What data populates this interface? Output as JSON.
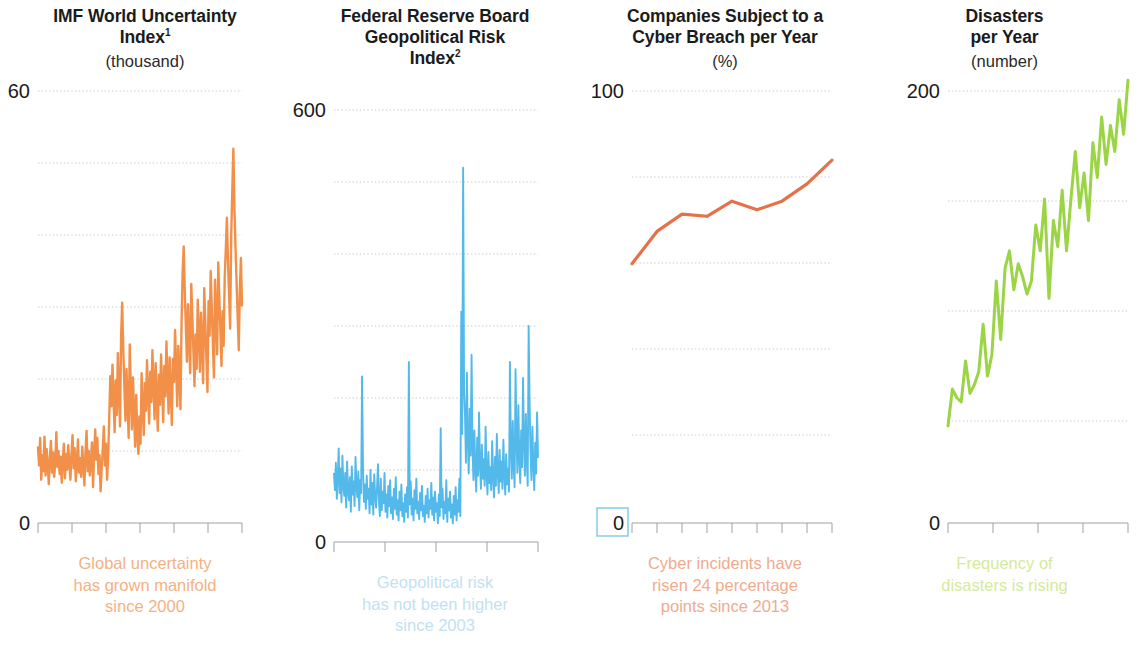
{
  "figure": {
    "background": "#ffffff",
    "panel_count": 4
  },
  "panels": [
    {
      "title_main": "IMF World Uncertainty",
      "title_second": "Index",
      "title_sup": "1",
      "units": "(thousand)",
      "y_top_label": "60",
      "y_bottom_label": "0",
      "caption": "Global uncertainty has grown manifold since 2000",
      "caption_line1": "Global uncertainty",
      "caption_line2": "has grown manifold",
      "caption_line3": "since 2000",
      "line_color": "#F2904A",
      "caption_color": "#f4b183",
      "highlighted_zero": false
    },
    {
      "title_main": "Federal Reserve Board",
      "title_second": "Geopolitical Risk",
      "title_third": "Index",
      "title_sup": "2",
      "units": "",
      "y_top_label": "600",
      "y_bottom_label": "0",
      "caption": "Geopolitical risk has not been higher since 2003",
      "caption_line1": "Geopolitical risk",
      "caption_line2": "has not been higher",
      "caption_line3": "since 2003",
      "line_color": "#52B9EA",
      "caption_color": "#bfe2f2",
      "highlighted_zero": false
    },
    {
      "title_main": "Companies Subject to a",
      "title_second": "Cyber Breach per Year",
      "units": "(%)",
      "y_top_label": "100",
      "y_bottom_label": "0",
      "caption": "Cyber incidents have risen 24 percentage points since 2013",
      "caption_line1": "Cyber incidents have",
      "caption_line2": "risen 24 percentage",
      "caption_line3": "points since 2013",
      "line_color": "#E4714A",
      "caption_color": "#f0ab8d",
      "highlighted_zero": true,
      "highlight_color": "#8ecfe8"
    },
    {
      "title_main": "Disasters",
      "title_second": "per Year",
      "units": "(number)",
      "y_top_label": "200",
      "y_bottom_label": "0",
      "caption": "Frequency of disasters is rising",
      "caption_line1": "Frequency of",
      "caption_line2": "disasters is rising",
      "caption_line3": "",
      "line_color": "#9BD445",
      "caption_color": "#d5ea9a",
      "highlighted_zero": false
    }
  ],
  "chart_data": [
    {
      "type": "line",
      "title": "IMF World Uncertainty Index",
      "ylabel": "thousand",
      "xlabel": "",
      "ylim": [
        0,
        60
      ],
      "gridlines": [
        10,
        20,
        30,
        40,
        50,
        60
      ],
      "x_ticks": 7,
      "color": "#F2904A",
      "values": [
        10.5,
        8.0,
        11.8,
        6.0,
        9.4,
        7.2,
        12.0,
        6.6,
        10.3,
        8.2,
        5.4,
        9.0,
        11.4,
        7.0,
        9.8,
        6.4,
        8.4,
        12.6,
        7.8,
        10.0,
        6.8,
        9.2,
        5.6,
        8.8,
        11.0,
        6.2,
        9.6,
        7.4,
        10.8,
        8.6,
        6.0,
        9.4,
        12.2,
        7.6,
        10.4,
        5.8,
        8.2,
        11.6,
        7.0,
        9.0,
        6.4,
        10.6,
        8.0,
        5.2,
        9.8,
        12.8,
        7.2,
        10.0,
        6.6,
        8.4,
        11.2,
        5.0,
        9.6,
        13.0,
        8.8,
        11.8,
        6.8,
        9.4,
        4.4,
        7.6,
        10.2,
        13.4,
        8.0,
        11.0,
        6.0,
        9.2,
        14.6,
        20.4,
        16.2,
        22.0,
        17.4,
        12.6,
        19.8,
        15.0,
        23.6,
        18.2,
        13.4,
        26.0,
        30.6,
        24.2,
        19.0,
        14.2,
        21.4,
        16.6,
        11.8,
        24.8,
        18.6,
        13.0,
        20.2,
        15.4,
        10.6,
        17.8,
        12.4,
        9.6,
        14.8,
        11.0,
        20.8,
        16.0,
        12.2,
        19.4,
        15.6,
        22.6,
        18.0,
        13.8,
        21.0,
        16.8,
        24.0,
        19.2,
        14.4,
        22.2,
        17.2,
        12.8,
        20.6,
        16.4,
        23.4,
        18.8,
        14.0,
        21.8,
        17.6,
        25.2,
        20.0,
        15.2,
        23.0,
        18.4,
        13.6,
        22.8,
        19.6,
        26.8,
        21.6,
        16.2,
        24.6,
        20.4,
        15.8,
        28.0,
        34.8,
        38.4,
        32.0,
        27.2,
        22.4,
        30.4,
        25.6,
        20.8,
        33.2,
        28.6,
        23.8,
        19.0,
        26.2,
        21.4,
        31.0,
        26.4,
        21.0,
        29.2,
        24.4,
        19.4,
        32.6,
        27.8,
        23.0,
        18.2,
        30.8,
        26.0,
        35.0,
        29.8,
        25.0,
        20.2,
        33.8,
        28.2,
        23.4,
        36.2,
        31.4,
        26.6,
        21.8,
        29.4,
        24.6,
        34.2,
        38.0,
        42.4,
        36.6,
        31.8,
        27.0,
        40.0,
        46.2,
        52.0,
        43.8,
        38.2,
        33.4,
        28.6,
        24.0,
        32.4,
        36.8,
        30.2
      ],
      "annotation": "Global uncertainty has grown manifold since 2000"
    },
    {
      "type": "line",
      "title": "Federal Reserve Board Geopolitical Risk Index",
      "ylabel": "",
      "xlabel": "",
      "ylim": [
        0,
        600
      ],
      "gridlines": [
        100,
        200,
        300,
        400,
        500,
        600
      ],
      "x_ticks": 5,
      "color": "#52B9EA",
      "values": [
        95,
        72,
        110,
        60,
        88,
        130,
        68,
        102,
        55,
        120,
        78,
        64,
        96,
        48,
        112,
        70,
        58,
        90,
        42,
        105,
        66,
        84,
        50,
        118,
        76,
        62,
        98,
        44,
        86,
        68,
        230,
        104,
        56,
        80,
        46,
        92,
        60,
        74,
        40,
        100,
        52,
        82,
        38,
        94,
        64,
        48,
        76,
        108,
        58,
        36,
        88,
        44,
        70,
        54,
        96,
        42,
        66,
        34,
        78,
        50,
        86,
        40,
        62,
        32,
        74,
        46,
        90,
        38,
        58,
        30,
        70,
        44,
        80,
        36,
        54,
        28,
        66,
        42,
        76,
        34,
        250,
        52,
        84,
        38,
        60,
        30,
        72,
        46,
        88,
        40,
        56,
        32,
        68,
        44,
        78,
        36,
        50,
        28,
        64,
        40,
        74,
        34,
        58,
        46,
        82,
        38,
        62,
        30,
        70,
        42,
        54,
        26,
        66,
        36,
        158,
        48,
        74,
        32,
        56,
        40,
        86,
        28,
        60,
        44,
        70,
        34,
        52,
        26,
        64,
        38,
        76,
        30,
        58,
        42,
        88,
        36,
        320,
        150,
        520,
        210,
        175,
        110,
        235,
        140,
        95,
        185,
        120,
        260,
        130,
        86,
        155,
        100,
        70,
        145,
        92,
        180,
        108,
        74,
        135,
        88,
        115,
        78,
        160,
        96,
        66,
        125,
        82,
        104,
        72,
        140,
        90,
        62,
        118,
        78,
        150,
        98,
        68,
        128,
        84,
        112,
        74,
        142,
        94,
        66,
        122,
        80,
        102,
        70,
        250,
        132,
        88,
        168,
        108,
        76,
        240,
        145,
        96,
        190,
        120,
        82,
        155,
        104,
        228,
        140,
        92,
        178,
        115,
        78,
        300,
        195,
        126,
        86,
        160,
        108,
        72,
        138,
        95,
        180,
        118
      ],
      "annotation": "Geopolitical risk has not been higher since 2003"
    },
    {
      "type": "line",
      "title": "Companies Subject to a Cyber Breach per Year",
      "ylabel": "%",
      "xlabel": "",
      "ylim": [
        0,
        100
      ],
      "gridlines": [
        20,
        40,
        60,
        80,
        100
      ],
      "x_ticks": 9,
      "color": "#E4714A",
      "categories": [
        "2013",
        "2014",
        "2015",
        "2016",
        "2017",
        "2018",
        "2019",
        "2020",
        "2021"
      ],
      "values": [
        60,
        67.5,
        71.5,
        71,
        74.5,
        72.5,
        74.5,
        78.5,
        84
      ],
      "annotation": "Cyber incidents have risen 24 percentage points since 2013"
    },
    {
      "type": "line",
      "title": "Disasters per Year",
      "ylabel": "number",
      "xlabel": "",
      "ylim": [
        0,
        200
      ],
      "gridlines": [
        50,
        100,
        150,
        200
      ],
      "x_ticks": 5,
      "color": "#9BD445",
      "values": [
        45,
        62,
        58,
        56,
        75,
        60,
        64,
        70,
        92,
        68,
        78,
        112,
        85,
        118,
        126,
        108,
        120,
        114,
        106,
        112,
        138,
        126,
        150,
        104,
        140,
        128,
        154,
        126,
        150,
        172,
        146,
        162,
        140,
        176,
        160,
        188,
        166,
        184,
        172,
        196,
        180,
        205
      ],
      "annotation": "Frequency of disasters is rising"
    }
  ]
}
